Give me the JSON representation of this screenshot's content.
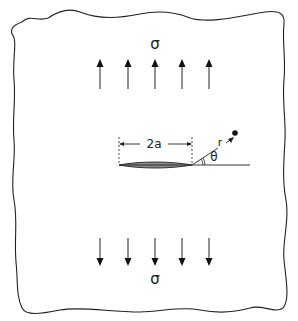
{
  "diagram": {
    "stress_top_label": "σ",
    "stress_bottom_label": "σ",
    "crack_length_label": "2a",
    "radius_label": "r",
    "angle_label": "θ",
    "arrow_count_top": 5,
    "arrow_count_bottom": 5,
    "colors": {
      "line": "#222222",
      "crack_fill": "#8a8a8a",
      "background": "#ffffff"
    }
  }
}
